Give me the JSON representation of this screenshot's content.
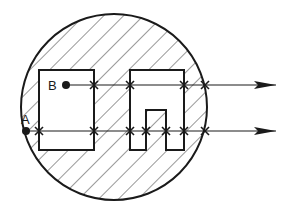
{
  "diagram": {
    "title": "",
    "colors": {
      "ink": "#1a1a1a",
      "background": "#ffffff",
      "hatch": "#333333"
    },
    "circle": {
      "cx": 114,
      "cy": 107,
      "r": 93,
      "fill": "hatched"
    },
    "shapes": [
      {
        "id": "left-rectangle",
        "type": "rectangle",
        "x": 39,
        "y": 70,
        "w": 55,
        "h": 80
      },
      {
        "id": "right-notched-block",
        "type": "polygon",
        "points": "130,70 184,70 184,150 166,150 166,110 146,110 146,150 130,150"
      }
    ],
    "points": [
      {
        "label": "B",
        "x": 66,
        "y": 85
      },
      {
        "label": "A",
        "x": 26,
        "y": 131
      }
    ],
    "rays": [
      {
        "from": "B",
        "y": 85,
        "x_start": 66,
        "x_end": 276,
        "crossings": [
          94,
          130,
          184,
          205
        ]
      },
      {
        "from": "A",
        "y": 131,
        "x_start": 26,
        "x_end": 276,
        "crossings": [
          39,
          94,
          130,
          146,
          166,
          184,
          205
        ]
      }
    ]
  }
}
